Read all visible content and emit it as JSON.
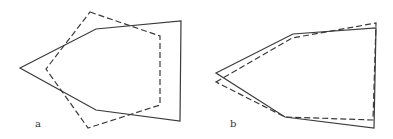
{
  "panels": [
    {
      "label": "a",
      "solid_polygon": [
        [
          20,
          68
        ],
        [
          96,
          29
        ],
        [
          181,
          21
        ],
        [
          180,
          121
        ],
        [
          96,
          110
        ]
      ],
      "dashed_polygon": [
        [
          90,
          12
        ],
        [
          160,
          36
        ],
        [
          160,
          105
        ],
        [
          88,
          128
        ],
        [
          46,
          69
        ]
      ]
    },
    {
      "label": "b",
      "solid_polygon": [
        [
          216,
          73
        ],
        [
          293,
          34
        ],
        [
          376,
          28
        ],
        [
          374,
          128
        ],
        [
          285,
          117
        ]
      ],
      "dashed_polygon": [
        [
          216,
          82
        ],
        [
          292,
          38
        ],
        [
          376,
          23
        ],
        [
          373,
          120
        ],
        [
          285,
          117
        ]
      ]
    }
  ],
  "colors": {
    "stroke": "#3a3a3a"
  }
}
